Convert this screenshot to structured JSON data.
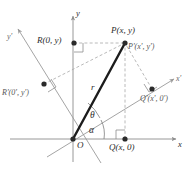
{
  "figure": {
    "colors": {
      "axis": "#8c8c8c",
      "axis_prime": "#9a9a9a",
      "dashed": "#a8a8a8",
      "vector": "#1c1c1c",
      "point": "#2a2a2a",
      "text": "#2b2b2b",
      "text_prime": "#555555",
      "background": "#ffffff"
    },
    "axes": [
      {
        "name": "y-axis",
        "label": "y",
        "label_x": 76,
        "label_y": 10
      },
      {
        "name": "x-axis",
        "label": "x",
        "label_x": 178,
        "label_y": 142
      },
      {
        "name": "y-prime-axis",
        "label": "y'",
        "label_x": 7,
        "label_y": 35
      },
      {
        "name": "x-prime-axis",
        "label": "x'",
        "label_x": 177,
        "label_y": 78
      }
    ],
    "points": [
      {
        "name": "origin",
        "label": "O",
        "dot_x": 73,
        "dot_y": 139,
        "label_x": 77,
        "label_y": 144,
        "has_dot": true
      },
      {
        "name": "point-p",
        "label": "P(x, y)",
        "dot_x": 125,
        "dot_y": 43,
        "label_x": 113,
        "label_y": 30,
        "has_dot": true
      },
      {
        "name": "point-p-prime",
        "label": "P'(x', y')",
        "dot_x": 125,
        "dot_y": 43,
        "label_x": 129,
        "label_y": 46,
        "has_dot": false
      },
      {
        "name": "point-r",
        "label": "R(0, y)",
        "dot_x": 74,
        "dot_y": 43,
        "label_x": 38,
        "label_y": 38,
        "has_dot": true
      },
      {
        "name": "point-q",
        "label": "Q(x, 0)",
        "dot_x": 125,
        "dot_y": 139,
        "label_x": 110,
        "label_y": 147,
        "has_dot": true
      },
      {
        "name": "point-r-prime",
        "label": "R'(0', y')",
        "dot_x": 44,
        "dot_y": 84,
        "label_x": 3,
        "label_y": 93,
        "has_dot": true
      },
      {
        "name": "point-q-prime",
        "label": "Q'(x', 0')",
        "dot_x": 152,
        "dot_y": 89,
        "label_x": 141,
        "label_y": 98,
        "has_dot": true
      }
    ],
    "segments": [
      {
        "name": "radius-vector",
        "label": "r",
        "label_x": 92,
        "label_y": 87
      },
      {
        "name": "angle-theta",
        "label": "θ",
        "label_x": 91,
        "label_y": 116
      },
      {
        "name": "angle-alpha",
        "label": "α",
        "label_x": 90,
        "label_y": 131
      }
    ]
  }
}
